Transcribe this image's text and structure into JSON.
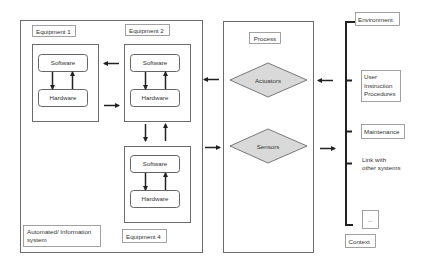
{
  "diagram": {
    "automated_system": {
      "label": "Automated/ Information system",
      "label_lines": [
        "Automated/ Information",
        "system"
      ],
      "equipment": [
        {
          "label": "Equipment 1",
          "software": "Software",
          "hardware": "Hardware"
        },
        {
          "label": "Equipment 2",
          "software": "Software",
          "hardware": "Hardware"
        },
        {
          "label": "Equipment 4",
          "software": "Software",
          "hardware": "Hardware"
        }
      ]
    },
    "process": {
      "label": "Process",
      "actuators": "Actuators",
      "sensors": "Sensors"
    },
    "context": {
      "label": "Context",
      "items": [
        {
          "label": "Environment",
          "lines": [
            "Environment"
          ],
          "boxed": true
        },
        {
          "label": "User Instruction Procedures",
          "lines": [
            "User",
            "Instruction",
            "Procedures"
          ],
          "boxed": true
        },
        {
          "label": "Maintenance",
          "lines": [
            "Maintenance"
          ],
          "boxed": true
        },
        {
          "label": "Link with other systems",
          "lines": [
            "Link with",
            "other systems"
          ],
          "boxed": false
        },
        {
          "label": "...",
          "lines": [
            "..."
          ],
          "boxed": true
        }
      ]
    },
    "colors": {
      "diamond_fill": "#d9d9d9",
      "line": "#222222",
      "border": "#6b6b6b"
    }
  }
}
